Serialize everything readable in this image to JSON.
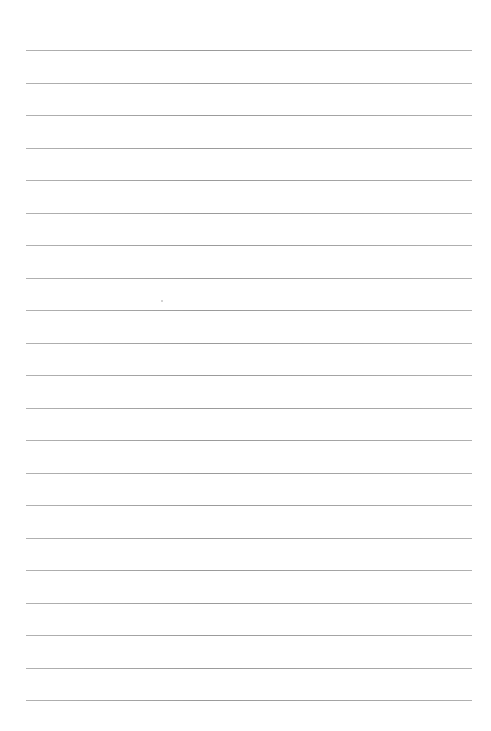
{
  "page": {
    "type": "ruled-paper",
    "background_color": "#ffffff",
    "line_color": "#999999",
    "line_count": 21,
    "line_start_x": 26,
    "line_end_x": 472,
    "first_line_y": 50,
    "line_spacing": 32.5,
    "content_text": ""
  }
}
